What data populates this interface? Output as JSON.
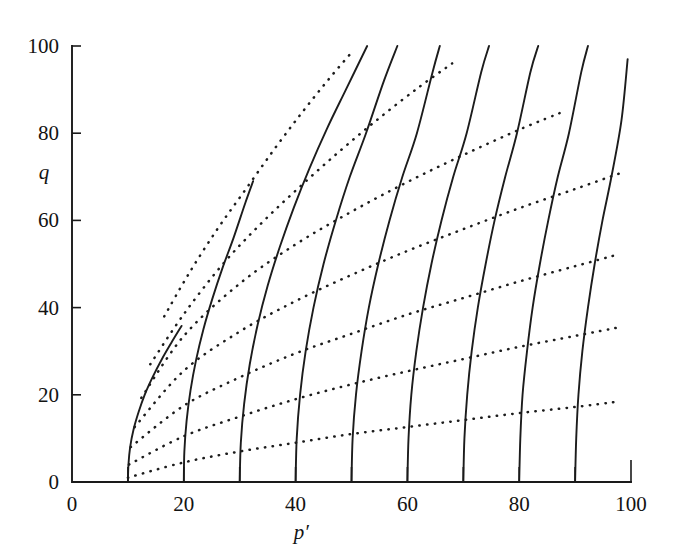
{
  "figure": {
    "background_color": "#ffffff",
    "ink_color": "#1c1c1c"
  },
  "axis": {
    "x_title": "p′",
    "y_title": "q",
    "x_tick_labels": [
      "0",
      "20",
      "40",
      "60",
      "80",
      "100"
    ],
    "y_tick_labels": [
      "0",
      "20",
      "40",
      "60",
      "80",
      "100"
    ]
  },
  "chart_data": {
    "type": "line",
    "title": "",
    "subtitle": "",
    "xlabel": "p′",
    "ylabel": "q",
    "xlim": [
      0,
      100
    ],
    "ylim": [
      0,
      100
    ],
    "xticks": [
      0,
      10,
      20,
      30,
      40,
      50,
      60,
      70,
      80,
      90,
      100
    ],
    "xticklabels": [
      "0",
      "",
      "20",
      "",
      "40",
      "",
      "60",
      "",
      "80",
      "",
      "100"
    ],
    "yticks": [
      0,
      20,
      40,
      60,
      80,
      100
    ],
    "yticklabels": [
      "0",
      "20",
      "40",
      "60",
      "80",
      "100"
    ],
    "grid": false,
    "legend": null,
    "annotations": [],
    "series": [
      {
        "name": "undrained effective stress path p0=10",
        "style": "solid",
        "color": "#1c1c1c",
        "x": [
          10.0,
          10.1,
          10.4,
          11.0,
          11.9,
          13.0,
          14.4,
          16.0,
          17.8,
          19.6
        ],
        "y": [
          0.0,
          4.0,
          8.0,
          12.0,
          16.0,
          20.0,
          24.0,
          28.0,
          32.0,
          35.8
        ]
      },
      {
        "name": "undrained effective stress path p0=20",
        "style": "solid",
        "color": "#1c1c1c",
        "x": [
          20.0,
          20.1,
          20.5,
          21.2,
          22.2,
          23.5,
          25.1,
          26.9,
          28.9,
          31.0,
          32.4
        ],
        "y": [
          0.0,
          7.0,
          14.0,
          21.0,
          28.0,
          35.0,
          42.0,
          49.0,
          56.0,
          64.0,
          69.0
        ]
      },
      {
        "name": "undrained effective stress path p0=30",
        "style": "solid",
        "color": "#1c1c1c",
        "x": [
          30.0,
          30.2,
          30.8,
          31.8,
          33.2,
          35.0,
          37.2,
          39.7,
          42.5,
          45.6,
          49.0,
          52.8
        ],
        "y": [
          0.0,
          9.0,
          18.0,
          27.0,
          36.0,
          45.0,
          54.0,
          63.0,
          72.0,
          81.0,
          90.0,
          100.0
        ]
      },
      {
        "name": "undrained effective stress path p0=40",
        "style": "solid",
        "color": "#1c1c1c",
        "x": [
          40.0,
          40.2,
          40.8,
          41.8,
          43.2,
          45.0,
          47.2,
          49.7,
          52.6,
          55.8,
          58.2
        ],
        "y": [
          0.0,
          10.0,
          20.0,
          30.0,
          40.0,
          50.0,
          60.0,
          70.0,
          80.0,
          92.0,
          100.0
        ]
      },
      {
        "name": "undrained effective stress path p0=50",
        "style": "solid",
        "color": "#1c1c1c",
        "x": [
          50.0,
          50.2,
          50.8,
          51.8,
          53.1,
          54.8,
          56.8,
          59.1,
          61.7,
          64.5,
          65.8
        ],
        "y": [
          0.0,
          10.0,
          20.0,
          30.0,
          40.0,
          50.0,
          60.0,
          70.0,
          80.0,
          94.0,
          100.0
        ]
      },
      {
        "name": "undrained effective stress path p0=60",
        "style": "solid",
        "color": "#1c1c1c",
        "x": [
          60.0,
          60.2,
          60.7,
          61.6,
          62.8,
          64.3,
          66.1,
          68.2,
          70.6,
          73.2,
          74.6
        ],
        "y": [
          0.0,
          10.0,
          20.0,
          30.0,
          40.0,
          50.0,
          60.0,
          70.0,
          80.0,
          94.0,
          100.0
        ]
      },
      {
        "name": "undrained effective stress path p0=70",
        "style": "solid",
        "color": "#1c1c1c",
        "x": [
          70.0,
          70.2,
          70.7,
          71.5,
          72.6,
          74.0,
          75.6,
          77.5,
          79.6,
          82.0,
          83.4
        ],
        "y": [
          0.0,
          10.0,
          20.0,
          30.0,
          40.0,
          50.0,
          60.0,
          70.0,
          80.0,
          94.0,
          100.0
        ]
      },
      {
        "name": "undrained effective stress path p0=80",
        "style": "solid",
        "color": "#1c1c1c",
        "x": [
          80.0,
          80.2,
          80.6,
          81.4,
          82.4,
          83.7,
          85.2,
          86.9,
          88.9,
          91.1,
          92.3
        ],
        "y": [
          0.0,
          10.0,
          20.0,
          30.0,
          40.0,
          50.0,
          60.0,
          70.0,
          80.0,
          94.0,
          100.0
        ]
      },
      {
        "name": "undrained effective stress path p0=90",
        "style": "solid",
        "color": "#1c1c1c",
        "x": [
          90.0,
          90.2,
          90.6,
          91.3,
          92.3,
          93.5,
          94.9,
          96.5,
          98.3,
          99.4
        ],
        "y": [
          0.0,
          10.0,
          20.0,
          30.0,
          40.0,
          50.0,
          60.0,
          70.0,
          83.0,
          97.0
        ]
      },
      {
        "name": "constant voids-ratio line 1",
        "style": "dotted",
        "color": "#1c1c1c",
        "x": [
          10.0,
          20.0,
          30.0,
          40.0,
          50.0,
          60.0,
          70.0,
          80.0,
          90.0,
          98.0
        ],
        "y": [
          1.0,
          4.5,
          7.0,
          9.0,
          11.0,
          12.6,
          14.2,
          15.8,
          17.2,
          18.5
        ]
      },
      {
        "name": "constant voids-ratio line 2",
        "style": "dotted",
        "color": "#1c1c1c",
        "x": [
          10.2,
          20.0,
          30.0,
          40.0,
          50.0,
          60.0,
          70.0,
          80.0,
          90.0,
          98.0
        ],
        "y": [
          4.0,
          10.5,
          15.0,
          19.0,
          22.4,
          25.4,
          28.2,
          31.0,
          33.5,
          35.5
        ]
      },
      {
        "name": "constant voids-ratio line 3",
        "style": "dotted",
        "color": "#1c1c1c",
        "x": [
          10.5,
          20.0,
          30.0,
          40.0,
          50.0,
          60.0,
          70.0,
          80.0,
          90.0,
          98.0
        ],
        "y": [
          8.0,
          17.5,
          24.0,
          29.5,
          34.0,
          38.4,
          42.2,
          46.0,
          49.5,
          52.3
        ]
      },
      {
        "name": "constant voids-ratio line 4",
        "style": "dotted",
        "color": "#1c1c1c",
        "x": [
          11.2,
          20.0,
          30.0,
          40.0,
          50.0,
          60.0,
          70.0,
          80.0,
          90.0,
          98.0
        ],
        "y": [
          12.6,
          25.5,
          34.5,
          41.5,
          47.5,
          53.0,
          58.0,
          62.8,
          67.2,
          70.8
        ]
      },
      {
        "name": "constant voids-ratio line 5",
        "style": "dotted",
        "color": "#1c1c1c",
        "x": [
          12.4,
          20.0,
          30.0,
          40.0,
          50.0,
          60.0,
          70.0,
          80.0,
          88.0
        ],
        "y": [
          19.3,
          33.5,
          45.5,
          54.5,
          62.0,
          68.8,
          75.0,
          80.8,
          85.0
        ]
      },
      {
        "name": "constant voids-ratio line 6",
        "style": "dotted",
        "color": "#1c1c1c",
        "x": [
          14.0,
          20.0,
          27.0,
          34.0,
          41.0,
          48.0,
          55.0,
          62.0,
          68.0
        ],
        "y": [
          27.0,
          38.5,
          50.0,
          59.5,
          68.0,
          76.0,
          83.5,
          90.5,
          96.0
        ]
      },
      {
        "name": "constant voids-ratio line 7",
        "style": "dotted",
        "color": "#1c1c1c",
        "x": [
          16.5,
          21.0,
          26.0,
          31.0,
          36.0,
          41.0,
          46.0,
          50.0
        ],
        "y": [
          38.0,
          48.0,
          58.0,
          67.0,
          76.0,
          84.5,
          92.5,
          98.5
        ]
      }
    ]
  }
}
